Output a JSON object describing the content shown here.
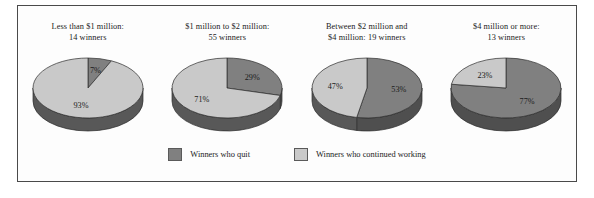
{
  "figure": {
    "border_color": "#4a4a4a",
    "background": "#fdfdfd"
  },
  "colors": {
    "quit": "#808080",
    "continued": "#c9c9c9",
    "rim_quit": "#4f4f4f",
    "rim_continued": "#585858",
    "outline": "#2b2b2b"
  },
  "panels": [
    {
      "title": "Less than $1 million:\n14 winners",
      "quit_pct": "7%",
      "continued_pct": "93%"
    },
    {
      "title": "$1 million to $2 million:\n55 winners",
      "quit_pct": "29%",
      "continued_pct": "71%"
    },
    {
      "title": "Between $2 million and\n$4 million: 19 winners",
      "quit_pct": "53%",
      "continued_pct": "47%"
    },
    {
      "title": "$4 million or more:\n13 winners",
      "quit_pct": "77%",
      "continued_pct": "23%"
    }
  ],
  "legend": [
    {
      "label": "Winners who quit",
      "color": "#808080"
    },
    {
      "label": "Winners who continued working",
      "color": "#c9c9c9"
    }
  ],
  "chart_data": {
    "type": "pie",
    "title": "",
    "subtitle": "",
    "legend_position": "bottom-center",
    "grid": false,
    "series_names": [
      "Winners who quit",
      "Winners who continued working"
    ],
    "charts": [
      {
        "title": "Less than $1 million: 14 winners",
        "prize_bracket": "Less than $1 million",
        "winners": 14,
        "labels": [
          "Winners who quit",
          "Winners who continued working"
        ],
        "values": [
          7,
          93
        ],
        "value_labels": [
          "7%",
          "93%"
        ],
        "units": "percent"
      },
      {
        "title": "$1 million to $2 million: 55 winners",
        "prize_bracket": "$1 million to $2 million",
        "winners": 55,
        "labels": [
          "Winners who quit",
          "Winners who continued working"
        ],
        "values": [
          29,
          71
        ],
        "value_labels": [
          "29%",
          "71%"
        ],
        "units": "percent"
      },
      {
        "title": "Between $2 million and $4 million: 19 winners",
        "prize_bracket": "Between $2 million and $4 million",
        "winners": 19,
        "labels": [
          "Winners who quit",
          "Winners who continued working"
        ],
        "values": [
          53,
          47
        ],
        "value_labels": [
          "53%",
          "47%"
        ],
        "units": "percent"
      },
      {
        "title": "$4 million or more: 13 winners",
        "prize_bracket": "$4 million or more",
        "winners": 13,
        "labels": [
          "Winners who quit",
          "Winners who continued working"
        ],
        "values": [
          77,
          23
        ],
        "value_labels": [
          "77%",
          "23%"
        ],
        "units": "percent"
      }
    ]
  }
}
